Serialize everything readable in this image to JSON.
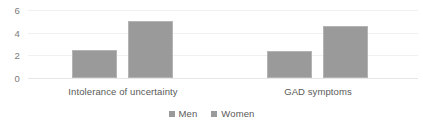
{
  "chart_data": {
    "type": "bar",
    "title": "",
    "subtitle": "",
    "xlabel": "",
    "ylabel": "",
    "categories": [
      "Intolerance of uncertainty",
      "GAD symptoms"
    ],
    "series": [
      {
        "name": "Men",
        "values": [
          2.5,
          2.4
        ],
        "color": "#9a9a9a"
      },
      {
        "name": "Women",
        "values": [
          5.0,
          4.6
        ],
        "color": "#9a9a9a"
      }
    ],
    "ylim": [
      0,
      6
    ],
    "yticks": [
      0,
      2,
      4,
      6
    ],
    "ytick_labels": [
      "0",
      "2",
      "4",
      "6"
    ],
    "grid": true,
    "grid_color": "#f0f0f0",
    "legend_position": "bottom",
    "background_color": "#ffffff",
    "axis_text_color": "#7a7a7a",
    "label_text_color": "#595959"
  }
}
